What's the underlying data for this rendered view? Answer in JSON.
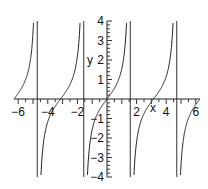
{
  "chart_data": {
    "type": "line",
    "title": "",
    "function": "tan(x)",
    "xlabel": "x",
    "ylabel": "y",
    "xlim": [
      -6.2832,
      6.2832
    ],
    "ylim": [
      -4,
      4
    ],
    "x_ticks": [
      -6,
      -4,
      -2,
      2,
      4,
      6
    ],
    "x_tick_labels": [
      "-6",
      "-4",
      "-2",
      "2",
      "4",
      "6"
    ],
    "y_ticks": [
      -4,
      -3,
      -2,
      -1,
      1,
      2,
      3,
      4
    ],
    "y_tick_labels": [
      "-4",
      "-3",
      "-2",
      "-1",
      "1",
      "2",
      "3",
      "4"
    ],
    "asymptotes": [
      -4.7124,
      -1.5708,
      1.5708,
      4.7124
    ],
    "grid": false,
    "legend": "none",
    "series": [
      {
        "name": "tan(x)",
        "color": "#222222"
      }
    ]
  }
}
